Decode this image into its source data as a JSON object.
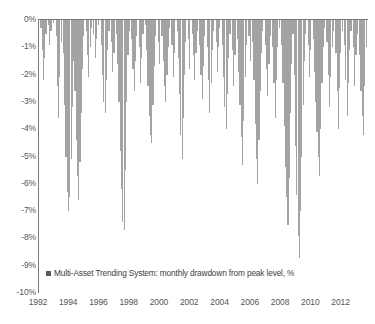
{
  "chart_data": {
    "type": "bar",
    "title": "",
    "subtitle": "",
    "xlabel": "",
    "ylabel": "",
    "ylim": [
      -10,
      0
    ],
    "xlim": [
      1992.0,
      2013.75
    ],
    "grid": false,
    "legend_position": "inside-bottom-left",
    "y_ticks": [
      "0%",
      "-1%",
      "-2%",
      "-3%",
      "-4%",
      "-5%",
      "-6%",
      "-7%",
      "-8%",
      "-9%",
      "-10%"
    ],
    "y_tick_values": [
      0,
      -1,
      -2,
      -3,
      -4,
      -5,
      -6,
      -7,
      -8,
      -9,
      -10
    ],
    "x_ticks": [
      "1992",
      "1994",
      "1996",
      "1998",
      "2000",
      "2002",
      "2004",
      "2006",
      "2008",
      "2010",
      "2012"
    ],
    "x_tick_values": [
      1992,
      1994,
      1996,
      1998,
      2000,
      2002,
      2004,
      2006,
      2008,
      2010,
      2012
    ],
    "series": [
      {
        "name": "Multi-Asset Trending System: monthly drawdown from peak level, %",
        "color": "#a3a3a3",
        "x": [
          1992.04,
          1992.13,
          1992.21,
          1992.29,
          1992.38,
          1992.46,
          1992.54,
          1992.63,
          1992.71,
          1992.79,
          1992.88,
          1992.96,
          1993.04,
          1993.13,
          1993.21,
          1993.29,
          1993.38,
          1993.46,
          1993.54,
          1993.63,
          1993.71,
          1993.79,
          1993.88,
          1993.96,
          1994.04,
          1994.13,
          1994.21,
          1994.29,
          1994.38,
          1994.46,
          1994.54,
          1994.63,
          1994.71,
          1994.79,
          1994.88,
          1994.96,
          1995.04,
          1995.13,
          1995.21,
          1995.29,
          1995.38,
          1995.46,
          1995.54,
          1995.63,
          1995.71,
          1995.79,
          1995.88,
          1995.96,
          1996.04,
          1996.13,
          1996.21,
          1996.29,
          1996.38,
          1996.46,
          1996.54,
          1996.63,
          1996.71,
          1996.79,
          1996.88,
          1996.96,
          1997.04,
          1997.13,
          1997.21,
          1997.29,
          1997.38,
          1997.46,
          1997.54,
          1997.63,
          1997.71,
          1997.79,
          1997.88,
          1997.96,
          1998.04,
          1998.13,
          1998.21,
          1998.29,
          1998.38,
          1998.46,
          1998.54,
          1998.63,
          1998.71,
          1998.79,
          1998.88,
          1998.96,
          1999.04,
          1999.13,
          1999.21,
          1999.29,
          1999.38,
          1999.46,
          1999.54,
          1999.63,
          1999.71,
          1999.79,
          1999.88,
          1999.96,
          2000.04,
          2000.13,
          2000.21,
          2000.29,
          2000.38,
          2000.46,
          2000.54,
          2000.63,
          2000.71,
          2000.79,
          2000.88,
          2000.96,
          2001.04,
          2001.13,
          2001.21,
          2001.29,
          2001.38,
          2001.46,
          2001.54,
          2001.63,
          2001.71,
          2001.79,
          2001.88,
          2001.96,
          2002.04,
          2002.13,
          2002.21,
          2002.29,
          2002.38,
          2002.46,
          2002.54,
          2002.63,
          2002.71,
          2002.79,
          2002.88,
          2002.96,
          2003.04,
          2003.13,
          2003.21,
          2003.29,
          2003.38,
          2003.46,
          2003.54,
          2003.63,
          2003.71,
          2003.79,
          2003.88,
          2003.96,
          2004.04,
          2004.13,
          2004.21,
          2004.29,
          2004.38,
          2004.46,
          2004.54,
          2004.63,
          2004.71,
          2004.79,
          2004.88,
          2004.96,
          2005.04,
          2005.13,
          2005.21,
          2005.29,
          2005.38,
          2005.46,
          2005.54,
          2005.63,
          2005.71,
          2005.79,
          2005.88,
          2005.96,
          2006.04,
          2006.13,
          2006.21,
          2006.29,
          2006.38,
          2006.46,
          2006.54,
          2006.63,
          2006.71,
          2006.79,
          2006.88,
          2006.96,
          2007.04,
          2007.13,
          2007.21,
          2007.29,
          2007.38,
          2007.46,
          2007.54,
          2007.63,
          2007.71,
          2007.79,
          2007.88,
          2007.96,
          2008.04,
          2008.13,
          2008.21,
          2008.29,
          2008.38,
          2008.46,
          2008.54,
          2008.63,
          2008.71,
          2008.79,
          2008.88,
          2008.96,
          2009.04,
          2009.13,
          2009.21,
          2009.29,
          2009.38,
          2009.46,
          2009.54,
          2009.63,
          2009.71,
          2009.79,
          2009.88,
          2009.96,
          2010.04,
          2010.13,
          2010.21,
          2010.29,
          2010.38,
          2010.46,
          2010.54,
          2010.63,
          2010.71,
          2010.79,
          2010.88,
          2010.96,
          2011.04,
          2011.13,
          2011.21,
          2011.29,
          2011.38,
          2011.46,
          2011.54,
          2011.63,
          2011.71,
          2011.79,
          2011.88,
          2011.96,
          2012.04,
          2012.13,
          2012.21,
          2012.29,
          2012.38,
          2012.46,
          2012.54,
          2012.63,
          2012.71,
          2012.79,
          2012.88,
          2012.96,
          2013.04,
          2013.13,
          2013.21,
          2013.29,
          2013.38,
          2013.46,
          2013.54,
          2013.63
        ],
        "values": [
          0.0,
          -0.3,
          -1.1,
          -2.2,
          -1.4,
          -0.5,
          0.0,
          -0.2,
          -0.9,
          -0.4,
          0.0,
          -0.1,
          0.0,
          -0.6,
          -2.4,
          -3.6,
          -2.1,
          -0.8,
          0.0,
          -1.2,
          -3.1,
          -5.0,
          -6.3,
          -7.0,
          -6.5,
          -5.1,
          -3.2,
          -1.5,
          -2.6,
          -4.4,
          -5.7,
          -6.6,
          -5.2,
          -3.4,
          -1.8,
          -0.6,
          0.0,
          -0.4,
          -1.3,
          -2.1,
          -1.0,
          -0.3,
          0.0,
          -0.5,
          -1.4,
          -0.7,
          0.0,
          -0.2,
          0.0,
          -0.9,
          -2.0,
          -3.0,
          -3.4,
          -2.2,
          -1.1,
          -0.4,
          0.0,
          -0.8,
          -1.9,
          -1.2,
          0.0,
          -0.5,
          -1.6,
          -3.0,
          -4.8,
          -6.2,
          -7.4,
          -7.7,
          -5.5,
          -3.0,
          -1.3,
          -0.4,
          0.0,
          -0.7,
          -1.8,
          -2.6,
          -1.5,
          -0.6,
          0.0,
          -1.0,
          -2.3,
          -1.4,
          -0.5,
          0.0,
          -0.2,
          -1.1,
          -2.4,
          -3.5,
          -4.2,
          -4.5,
          -3.1,
          -1.7,
          -0.6,
          0.0,
          -0.8,
          -1.6,
          0.0,
          -0.6,
          -1.5,
          -2.4,
          -3.0,
          -2.0,
          -1.0,
          -0.3,
          0.0,
          -0.9,
          -2.1,
          -1.2,
          0.0,
          -0.4,
          -1.4,
          -2.7,
          -4.2,
          -5.1,
          -3.6,
          -2.0,
          -0.8,
          0.0,
          -0.7,
          -1.8,
          0.0,
          -0.5,
          -1.3,
          -2.2,
          -1.2,
          -0.4,
          0.0,
          -0.9,
          -2.0,
          -2.9,
          -1.7,
          -0.6,
          0.0,
          -1.0,
          -2.2,
          -3.4,
          -2.3,
          -1.1,
          -0.4,
          0.0,
          -0.8,
          -1.9,
          -1.0,
          -0.3,
          0.0,
          -0.9,
          -2.1,
          -3.2,
          -4.0,
          -2.7,
          -1.4,
          -0.5,
          0.0,
          -1.1,
          -2.4,
          -1.3,
          0.0,
          -0.7,
          -1.9,
          -3.1,
          -4.3,
          -5.3,
          -3.7,
          -2.1,
          -0.9,
          0.0,
          -0.6,
          -1.5,
          0.0,
          -0.8,
          -2.2,
          -3.8,
          -5.1,
          -6.0,
          -4.4,
          -2.6,
          -1.2,
          -0.4,
          0.0,
          -0.9,
          -1.8,
          -2.8,
          -1.6,
          -0.6,
          0.0,
          -1.0,
          -2.3,
          -3.6,
          -2.2,
          -1.0,
          -0.3,
          0.0,
          -0.9,
          -2.3,
          -3.9,
          -5.4,
          -6.5,
          -7.5,
          -5.8,
          -3.4,
          -1.6,
          -0.5,
          -2.0,
          -4.6,
          -6.4,
          -7.9,
          -8.7,
          -7.0,
          -5.0,
          -3.1,
          -1.5,
          -0.5,
          0.0,
          -0.9,
          -2.1,
          -1.1,
          0.0,
          -0.7,
          -1.9,
          -3.0,
          -4.1,
          -5.0,
          -5.7,
          -4.0,
          -2.3,
          -1.0,
          -0.3,
          0.0,
          -0.8,
          -2.0,
          -3.2,
          -2.1,
          -1.0,
          -0.4,
          0.0,
          -1.2,
          -2.6,
          -4.0,
          -2.5,
          -1.2,
          -0.4,
          0.0,
          -0.9,
          -2.2,
          -3.5,
          -2.3,
          -1.1,
          -0.4,
          0.0,
          -1.0,
          -2.4,
          -1.3,
          -0.5,
          0.0,
          -1.3,
          -2.6,
          -3.5,
          -4.2,
          -2.4,
          -1.0
        ]
      }
    ]
  },
  "legend": {
    "marker": "square-marker",
    "label": "Multi-Asset Trending System: monthly drawdown from peak level, %"
  },
  "colors": {
    "bar": "#a3a3a3",
    "axis": "#7a7a7a",
    "tick_text": "#555555",
    "legend_text": "#3d3d3d",
    "legend_swatch": "#595959",
    "background": "#ffffff"
  }
}
